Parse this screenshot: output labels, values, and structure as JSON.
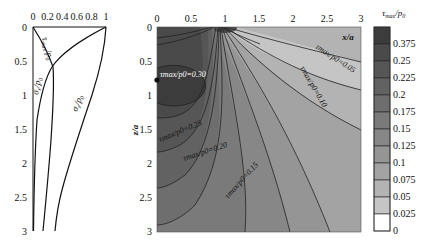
{
  "chart_data": [
    {
      "type": "line",
      "title": "",
      "xlabel": "",
      "ylabel": "z/a",
      "x_ticks": [
        "0",
        "0.2",
        "0.4",
        "0.6",
        "0.8",
        "1"
      ],
      "y_ticks": [
        "0",
        "0.5",
        "1",
        "1.5",
        "2",
        "2.5",
        "3"
      ],
      "xlim": [
        0,
        1
      ],
      "ylim": [
        3,
        0
      ],
      "grid": false,
      "series": [
        {
          "name": "σx/p0",
          "z": [
            0,
            0.25,
            0.5,
            0.75,
            1,
            1.5,
            2,
            2.5,
            3
          ],
          "values": [
            1.0,
            0.55,
            0.27,
            0.16,
            0.1,
            0.05,
            0.03,
            0.02,
            0.01
          ]
        },
        {
          "name": "τmax/p0",
          "z": [
            0,
            0.25,
            0.5,
            0.6,
            0.75,
            1,
            1.5,
            2,
            2.5,
            3
          ],
          "values": [
            0.0,
            0.18,
            0.27,
            0.3,
            0.29,
            0.27,
            0.23,
            0.19,
            0.16,
            0.13
          ]
        },
        {
          "name": "σz/p0",
          "z": [
            0,
            0.25,
            0.5,
            0.75,
            1,
            1.5,
            2,
            2.5,
            3
          ],
          "values": [
            1.0,
            0.96,
            0.89,
            0.8,
            0.71,
            0.55,
            0.45,
            0.37,
            0.3
          ]
        }
      ],
      "annotations": [
        "τmax/p0",
        "σx/p0",
        "σz/p0"
      ]
    },
    {
      "type": "heatmap",
      "title": "",
      "xlabel": "x/a",
      "ylabel": "z/a",
      "x_ticks": [
        "0",
        "0.5",
        "1",
        "1.5",
        "2",
        "2.5",
        "3"
      ],
      "y_ticks": [
        "0",
        "0.5",
        "1",
        "1.5",
        "2",
        "2.5",
        "3"
      ],
      "xlim": [
        0,
        3
      ],
      "ylim": [
        3,
        0
      ],
      "colorbar_title": "τmax/p0",
      "colorbar_levels": [
        "0.375",
        "0.25",
        "0.225",
        "0.2",
        "0.175",
        "0.15",
        "0.125",
        "0.1",
        "0.075",
        "0.05",
        "0.025",
        "0"
      ],
      "contour_labels": [
        {
          "text": "τmax/p0=0.30",
          "x": 0.1,
          "z": 0.7
        },
        {
          "text": "τmax/p0=0.25",
          "x": 0.3,
          "z": 1.45
        },
        {
          "text": "τmax/p0=0.20",
          "x": 0.7,
          "z": 1.9
        },
        {
          "text": "τmax/p0=0.15",
          "x": 1.4,
          "z": 2.5
        },
        {
          "text": "τmax/p0=0.10",
          "x": 2.0,
          "z": 0.9
        },
        {
          "text": "τmax/p0=0.05",
          "x": 2.5,
          "z": 0.5
        }
      ],
      "marker": {
        "x": 0,
        "z": 0.78
      }
    }
  ],
  "left": {
    "x_ticks": [
      "0",
      "0.2",
      "0.4",
      "0.6",
      "0.8",
      "1"
    ],
    "y_ticks": [
      "0",
      "0.5",
      "1",
      "1.5",
      "2",
      "2.5",
      "3"
    ],
    "label_tau": "τ",
    "label_tau_sub": "max",
    "label_tau_p": "/p",
    "label_sx": "σ",
    "label_sx_sub": "x",
    "label_sz": "σ",
    "label_sz_sub": "z",
    "label_p": "/p",
    "label_p_sub": "0"
  },
  "right": {
    "x_ticks": [
      "0",
      "0.5",
      "1",
      "1.5",
      "2",
      "2.5",
      "3"
    ],
    "y_ticks": [
      "0",
      "0.5",
      "1",
      "1.5",
      "2",
      "2.5",
      "3"
    ],
    "xlabel": "x/a",
    "ylabel": "z/a",
    "c030": "τmax/p0=0.30",
    "c025": "τmax/p0=0.25",
    "c020": "τmax/p0=0.20",
    "c015": "τmax/p0=0.15",
    "c010": "τmax/p0=0.10",
    "c005": "τmax/p0=0.05"
  },
  "colorbar": {
    "title_main": "τ",
    "title_sub": "max",
    "title_rest": "/p",
    "title_sub2": "0",
    "levels": [
      "0.375",
      "0.25",
      "0.225",
      "0.2",
      "0.175",
      "0.15",
      "0.125",
      "0.1",
      "0.075",
      "0.05",
      "0.025",
      "0"
    ],
    "colors": [
      "#3c3c3c",
      "#4a4a4a",
      "#565656",
      "#626262",
      "#6e6e6e",
      "#7a7a7a",
      "#878787",
      "#959595",
      "#a3a3a3",
      "#b3b3b3",
      "#c5c5c5",
      "#ffffff"
    ]
  }
}
